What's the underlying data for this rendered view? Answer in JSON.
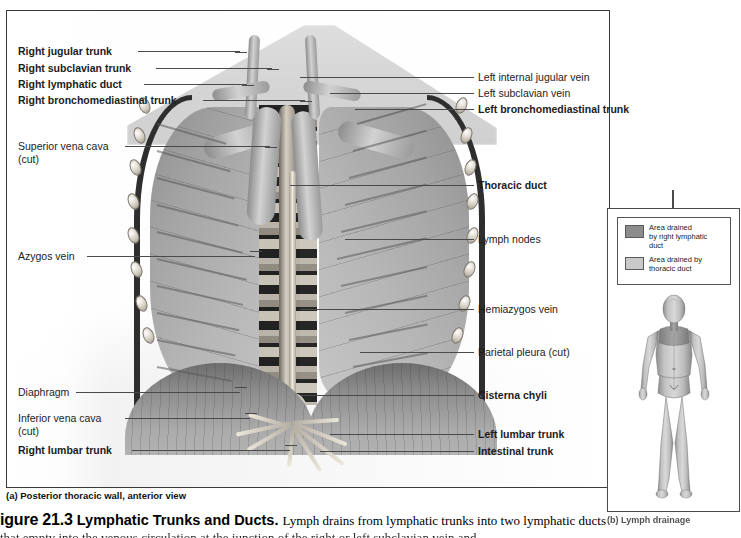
{
  "figure": {
    "number": "igure 21.3",
    "title": "Lymphatic Trunks and Ducts.",
    "body": "Lymph drains from lymphatic trunks into two lymphatic ducts",
    "line2": "that empty into the venous circulation at the junction of the right or left subclavian vein and"
  },
  "panel_a": {
    "caption": "(a) Posterior thoracic wall, anterior view",
    "labels_left": [
      {
        "text": "Right jugular trunk",
        "bold": true
      },
      {
        "text": "Right subclavian trunk",
        "bold": true
      },
      {
        "text": "Right lymphatic duct",
        "bold": true
      },
      {
        "text": "Right bronchomediastinal trunk",
        "bold": true
      },
      {
        "text": "Superior vena cava\n(cut)",
        "bold": false
      },
      {
        "text": "Azygos vein",
        "bold": false
      },
      {
        "text": "Diaphragm",
        "bold": false
      },
      {
        "text": "Inferior vena cava\n(cut)",
        "bold": false
      },
      {
        "text": "Right lumbar trunk",
        "bold": true
      }
    ],
    "labels_right": [
      {
        "text": "Left internal jugular vein",
        "bold": false
      },
      {
        "text": "Left subclavian vein",
        "bold": false
      },
      {
        "text": "Left bronchomediastinal trunk",
        "bold": true
      },
      {
        "text": "Thoracic duct",
        "bold": true
      },
      {
        "text": "Lymph nodes",
        "bold": false
      },
      {
        "text": "Hemiazygos vein",
        "bold": false
      },
      {
        "text": "Parietal pleura (cut)",
        "bold": false
      },
      {
        "text": "Cisterna chyli",
        "bold": true
      },
      {
        "text": "Left lumbar trunk",
        "bold": true
      },
      {
        "text": "Intestinal trunk",
        "bold": true
      }
    ]
  },
  "panel_b": {
    "caption": "(b) Lymph drainage",
    "legend": [
      {
        "text": "Area drained\nby right lymphatic\nduct",
        "color": "#8c8c8c"
      },
      {
        "text": "Area drained by\nthoracic duct",
        "color": "#c9c9c9"
      }
    ]
  }
}
